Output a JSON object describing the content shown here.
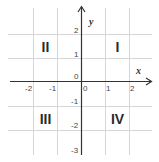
{
  "diagram": {
    "type": "cartesian-coordinate-plane",
    "axes": {
      "x_label": "x",
      "y_label": "y",
      "x_ticks": [
        "-2",
        "-1",
        "0",
        "1",
        "2"
      ],
      "y_ticks": [
        "2",
        "1",
        "0",
        "-1",
        "-2",
        "-3"
      ]
    },
    "quadrants": {
      "q1": "I",
      "q2": "II",
      "q3": "III",
      "q4": "IV"
    },
    "colors": {
      "axis": "#333333",
      "grid": "#d6d6d6",
      "text": "#444444"
    }
  }
}
